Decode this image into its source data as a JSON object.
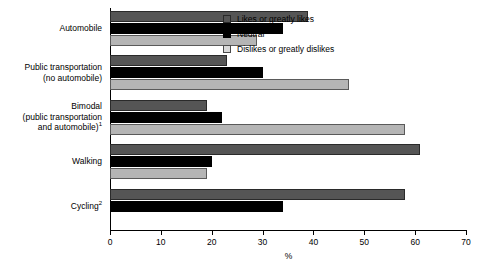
{
  "chart_data": {
    "type": "bar",
    "orientation": "horizontal",
    "title": "",
    "xlabel": "%",
    "ylabel": "",
    "xlim": [
      0,
      70
    ],
    "xticks": [
      0,
      10,
      20,
      30,
      40,
      50,
      60,
      70
    ],
    "xtick_labels": [
      "0",
      "10",
      "20",
      "30",
      "40",
      "50",
      "60",
      "70"
    ],
    "grid": false,
    "legend_position": "top-right",
    "categories": [
      "Automobile",
      "Public transportation (no automobile)",
      "Bimodal (public transportation and automobile)¹",
      "Walking",
      "Cycling²"
    ],
    "series": [
      {
        "name": "Likes or greatly likes",
        "color": "#555555",
        "values": [
          39,
          23,
          19,
          61,
          58
        ]
      },
      {
        "name": "Neutral",
        "color": "#000000",
        "values": [
          34,
          30,
          22,
          20,
          34
        ]
      },
      {
        "name": "Dislikes or greatly dislikes",
        "color": "#b5b5b5",
        "values": [
          29,
          47,
          58,
          19,
          null
        ]
      }
    ]
  },
  "categories_display": [
    {
      "lines": [
        "Automobile"
      ],
      "sup": ""
    },
    {
      "lines": [
        "Public transportation",
        "(no automobile)"
      ],
      "sup": ""
    },
    {
      "lines": [
        "Bimodal",
        "(public transportation",
        "and automobile)"
      ],
      "sup": "1"
    },
    {
      "lines": [
        "Walking"
      ],
      "sup": ""
    },
    {
      "lines": [
        "Cycling"
      ],
      "sup": "2"
    }
  ],
  "legend": {
    "items": [
      {
        "label": "Likes or greatly likes"
      },
      {
        "label": "Neutral"
      },
      {
        "label": "Dislikes or greatly dislikes"
      }
    ]
  },
  "axis": {
    "x_title": "%"
  }
}
